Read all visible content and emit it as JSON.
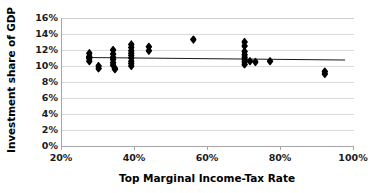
{
  "chart_data": {
    "type": "scatter",
    "title": "",
    "xlabel": "Top Marginal Income-Tax Rate",
    "ylabel": "Investment share of GDP",
    "xlim": [
      20,
      100
    ],
    "ylim": [
      0,
      16
    ],
    "xtick_labels": [
      "20%",
      "40%",
      "60%",
      "80%",
      "100%"
    ],
    "xticks": [
      20,
      40,
      60,
      80,
      100
    ],
    "ytick_labels": [
      "0%",
      "2%",
      "4%",
      "6%",
      "8%",
      "10%",
      "12%",
      "14%",
      "16%"
    ],
    "yticks": [
      0,
      2,
      4,
      6,
      8,
      10,
      12,
      14,
      16
    ],
    "grid": "horizontal",
    "legend": "none",
    "marker_shape": "diamond",
    "marker_color": "#000000",
    "points": [
      {
        "x": 27.5,
        "y": 11.6
      },
      {
        "x": 27.5,
        "y": 11.2
      },
      {
        "x": 27.5,
        "y": 10.9
      },
      {
        "x": 27.5,
        "y": 10.6
      },
      {
        "x": 30.0,
        "y": 10.0
      },
      {
        "x": 30.0,
        "y": 9.7
      },
      {
        "x": 34.0,
        "y": 12.0
      },
      {
        "x": 34.0,
        "y": 11.5
      },
      {
        "x": 34.0,
        "y": 11.1
      },
      {
        "x": 34.0,
        "y": 10.8
      },
      {
        "x": 34.0,
        "y": 10.4
      },
      {
        "x": 34.0,
        "y": 10.1
      },
      {
        "x": 34.5,
        "y": 9.7
      },
      {
        "x": 34.5,
        "y": 9.6
      },
      {
        "x": 39.0,
        "y": 12.7
      },
      {
        "x": 39.0,
        "y": 12.3
      },
      {
        "x": 39.0,
        "y": 11.9
      },
      {
        "x": 39.0,
        "y": 11.6
      },
      {
        "x": 39.0,
        "y": 11.3
      },
      {
        "x": 39.0,
        "y": 11.0
      },
      {
        "x": 39.0,
        "y": 10.6
      },
      {
        "x": 39.0,
        "y": 10.3
      },
      {
        "x": 39.0,
        "y": 10.0
      },
      {
        "x": 43.8,
        "y": 12.4
      },
      {
        "x": 43.8,
        "y": 11.9
      },
      {
        "x": 56.0,
        "y": 13.3
      },
      {
        "x": 70.0,
        "y": 13.0
      },
      {
        "x": 70.0,
        "y": 12.5
      },
      {
        "x": 70.0,
        "y": 11.8
      },
      {
        "x": 70.0,
        "y": 11.4
      },
      {
        "x": 70.0,
        "y": 11.1
      },
      {
        "x": 70.0,
        "y": 10.8
      },
      {
        "x": 70.0,
        "y": 10.5
      },
      {
        "x": 70.0,
        "y": 10.2
      },
      {
        "x": 71.5,
        "y": 10.6
      },
      {
        "x": 73.0,
        "y": 10.5
      },
      {
        "x": 77.0,
        "y": 10.6
      },
      {
        "x": 92.0,
        "y": 9.3
      },
      {
        "x": 92.0,
        "y": 9.0
      }
    ],
    "trendline": {
      "x_start": 26.5,
      "y_start": 11.15,
      "x_end": 97.5,
      "y_end": 10.85,
      "color": "#1a1a1a"
    }
  }
}
